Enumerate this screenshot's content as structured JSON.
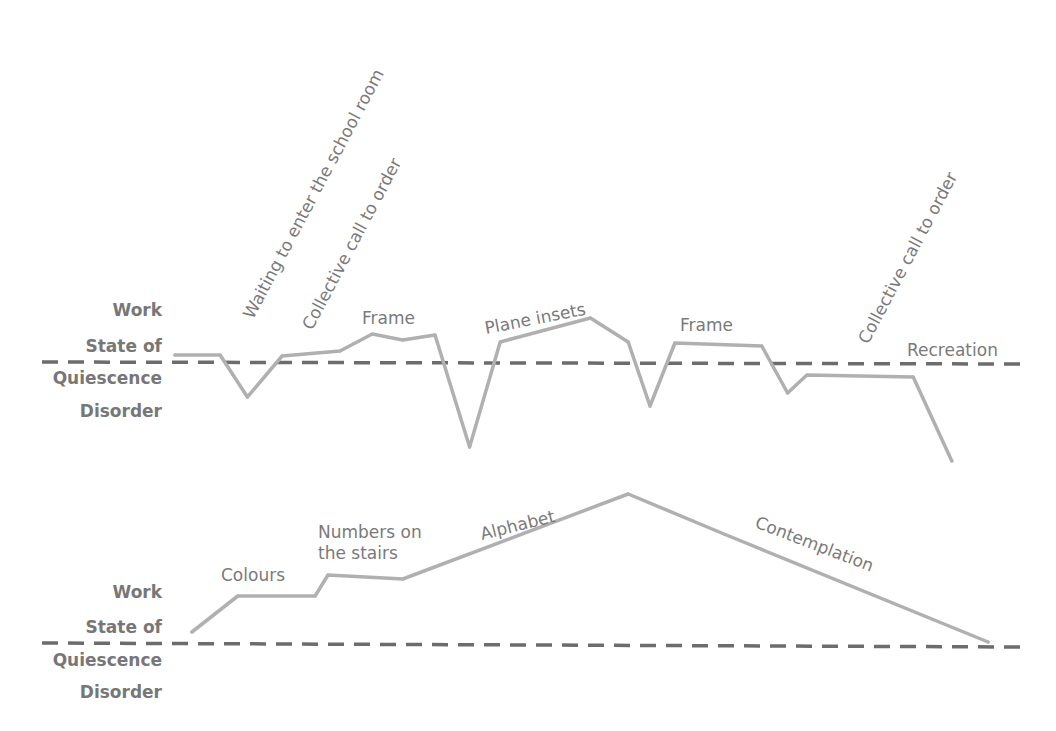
{
  "chart_data": [
    {
      "type": "line",
      "title": "",
      "xlabel": "",
      "ylabel": "",
      "y_levels": [
        "Work",
        "State of",
        "Quiescence",
        "Disorder"
      ],
      "baseline_label": "State of Quiescence",
      "baseline_value": 0,
      "xlim": [
        0,
        100
      ],
      "ylim": [
        -2,
        2
      ],
      "grid": false,
      "series": [
        {
          "name": "Lesson curve 1",
          "x": [
            0,
            5.6,
            9.0,
            13.3,
            20.5,
            24.5,
            28.3,
            32.3,
            36.6,
            40.4,
            51.6,
            56.3,
            59.0,
            62.1,
            72.9,
            76.1,
            78.5,
            91.7,
            96.5
          ],
          "y": [
            0.14,
            0.14,
            -0.7,
            0.12,
            0.22,
            0.56,
            0.44,
            0.54,
            -1.7,
            0.4,
            0.88,
            0.4,
            -0.88,
            0.38,
            0.32,
            -0.62,
            -0.26,
            -0.3,
            -1.98
          ]
        }
      ],
      "annotations": [
        {
          "text": "Waiting to enter the school room",
          "rotation": -60
        },
        {
          "text": "Collective call to order",
          "rotation": -60
        },
        {
          "text": "Frame",
          "rotation": 0
        },
        {
          "text": "Plane insets",
          "rotation": -10
        },
        {
          "text": "Frame",
          "rotation": 0
        },
        {
          "text": "Collective call to order",
          "rotation": -60
        },
        {
          "text": "Recreation",
          "rotation": 0
        }
      ]
    },
    {
      "type": "line",
      "title": "",
      "xlabel": "",
      "ylabel": "",
      "y_levels": [
        "Work",
        "State of",
        "Quiescence",
        "Disorder"
      ],
      "baseline_label": "State of Quiescence",
      "baseline_value": 0,
      "xlim": [
        0,
        100
      ],
      "ylim": [
        -2,
        3.2
      ],
      "grid": false,
      "series": [
        {
          "name": "Lesson curve 2",
          "x": [
            2.1,
            7.8,
            17.4,
            19.0,
            28.3,
            56.3,
            68.2,
            101.0
          ],
          "y": [
            0.22,
            0.94,
            0.94,
            1.36,
            1.28,
            2.98,
            2.18,
            0.02
          ]
        }
      ],
      "annotations": [
        {
          "text": "Colours",
          "rotation": 0
        },
        {
          "text": "Numbers on",
          "rotation": 0
        },
        {
          "text": "the stairs",
          "rotation": 0
        },
        {
          "text": "Alphabet",
          "rotation": -14
        },
        {
          "text": "Contemplation",
          "rotation": 22
        }
      ]
    }
  ]
}
